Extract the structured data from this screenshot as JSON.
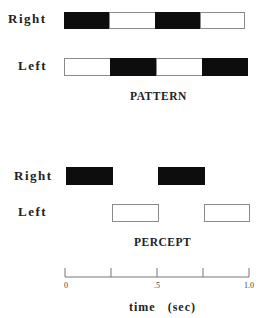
{
  "pattern": {
    "title": "PATTERN",
    "rows": [
      {
        "label": "Right",
        "segments": [
          "black",
          "white",
          "black",
          "white"
        ]
      },
      {
        "label": "Left",
        "segments": [
          "white",
          "black",
          "white",
          "black"
        ]
      }
    ]
  },
  "percept": {
    "title": "PERCEPT",
    "rows": [
      {
        "label": "Right",
        "segments": [
          "black",
          "none",
          "black",
          "none"
        ]
      },
      {
        "label": "Left",
        "segments": [
          "none",
          "white",
          "none",
          "white"
        ]
      }
    ]
  },
  "axis": {
    "title": "time   (sec)",
    "range": [
      0,
      1.0
    ],
    "ticks": [
      0,
      0.25,
      0.5,
      0.75,
      1.0
    ],
    "tick_labels": [
      "0",
      ".5",
      "1.0"
    ]
  },
  "colors": {
    "filled": "#0d0d0d",
    "empty": "#ffffff",
    "outline": "#8a8a8a"
  }
}
